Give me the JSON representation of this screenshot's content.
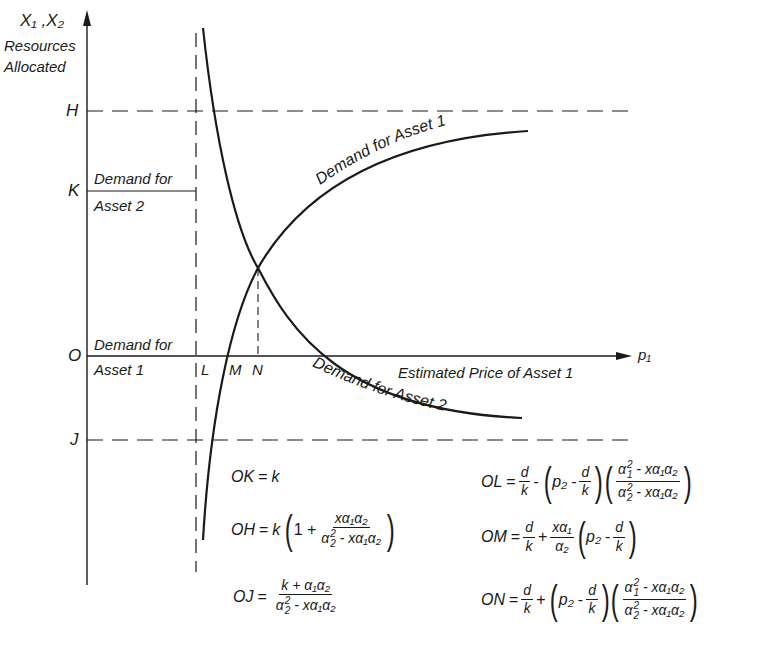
{
  "diagram": {
    "axes": {
      "y_label_top": "X₁ ,X₂",
      "y_label_line1": "Resources",
      "y_label_line2": "Allocated",
      "x_label_symbol": "p₁",
      "x_axis_title": "Estimated Price of Asset  1",
      "origin_label": "O"
    },
    "y_marks": {
      "H": "H",
      "K": "K",
      "J": "J"
    },
    "x_marks": {
      "L": "L",
      "M": "M",
      "N": "N"
    },
    "region_labels": {
      "demand_asset2_line1": "Demand for",
      "demand_asset2_line2": "Asset  2",
      "demand_asset1_line1": "Demand for",
      "demand_asset1_line2": "Asset  1"
    },
    "curves": [
      {
        "name": "Demand for Asset 1",
        "label": "Demand for Asset 1",
        "shape": "increasing concave, asymptotic below H"
      },
      {
        "name": "Demand for Asset 2",
        "label": "Demand for Asset 2",
        "shape": "decreasing convex, crosses x-axis"
      }
    ],
    "guides": {
      "H_line": "dashed horizontal at H",
      "J_line": "dashed horizontal at J",
      "L_line": "dashed vertical at L",
      "N_line": "dashed vertical from intersection to N"
    },
    "equations": {
      "OK": {
        "lhs": "OK",
        "rhs": "k"
      },
      "OH": {
        "lhs": "OH",
        "k": "k",
        "one": "1 +",
        "num": "xα₁α₂",
        "den_a": "α",
        "den_rest": " - xα₁α₂"
      },
      "OJ": {
        "lhs": "OJ",
        "num": "k + α₁α₂",
        "den_a": "α",
        "den_rest": " - xα₁α₂"
      },
      "OL": {
        "lhs": "OL",
        "d": "d",
        "k": "k",
        "op": "-",
        "p2": "p₂",
        "minus": "-",
        "num_a": "α",
        "num_rest": " - xα₁α₂",
        "den_a": "α",
        "den_rest": " - xα₁α₂"
      },
      "OM": {
        "lhs": "OM",
        "d": "d",
        "k": "k",
        "op": "+",
        "num": "xα₁",
        "den": "α₂",
        "p2": "p₂",
        "minus": "-"
      },
      "ON": {
        "lhs": "ON",
        "d": "d",
        "k": "k",
        "op": "+",
        "p2": "p₂",
        "minus": "-",
        "num_a": "α",
        "num_rest": " - xα₁α₂",
        "den_a": "α",
        "den_rest": " - xα₁α₂"
      },
      "eq_sign": "=",
      "sup2": "2",
      "sub1": "1",
      "sub2": "2"
    }
  }
}
